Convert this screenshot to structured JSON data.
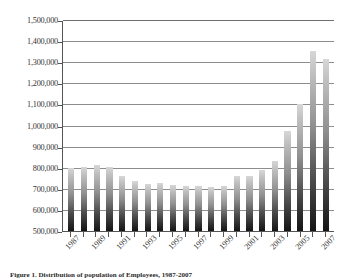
{
  "caption": "Figure 1. Distribution of population of Employees, 1987-2007",
  "axis": {
    "y_ticks": [
      "500,000",
      "600,000",
      "700,000",
      "800,000",
      "900,000",
      "1,000,000",
      "1,100,000",
      "1,200,000",
      "1,300,000",
      "1,400,000",
      "1,500,000"
    ],
    "x_ticks_visible": [
      "1987",
      "1989",
      "1991",
      "1993",
      "1995",
      "1997",
      "1999",
      "2001",
      "2003",
      "2005",
      "2007"
    ]
  },
  "chart_data": {
    "type": "bar",
    "title": "",
    "subtitle": "",
    "xlabel": "",
    "ylabel": "",
    "ylim": [
      500000,
      1500000
    ],
    "ytick_step": 100000,
    "grid": true,
    "legend": "none",
    "bar_color": "#8f8f8f",
    "bar_gradient": [
      "#d7d7d7",
      "#141414"
    ],
    "categories": [
      "1987",
      "1988",
      "1989",
      "1990",
      "1991",
      "1992",
      "1993",
      "1994",
      "1995",
      "1996",
      "1997",
      "1998",
      "1999",
      "2000",
      "2001",
      "2002",
      "2003",
      "2004",
      "2005",
      "2006",
      "2007"
    ],
    "tick_labels": [
      "1987",
      "",
      "1989",
      "",
      "1991",
      "",
      "1993",
      "",
      "1995",
      "",
      "1997",
      "",
      "1999",
      "",
      "2001",
      "",
      "2003",
      "",
      "2005",
      "",
      "2007"
    ],
    "values": [
      800000,
      802000,
      815000,
      803000,
      760000,
      738000,
      725000,
      726000,
      718000,
      712000,
      712000,
      710000,
      715000,
      760000,
      762000,
      790000,
      830000,
      975000,
      1100000,
      1355000,
      1315000
    ]
  }
}
